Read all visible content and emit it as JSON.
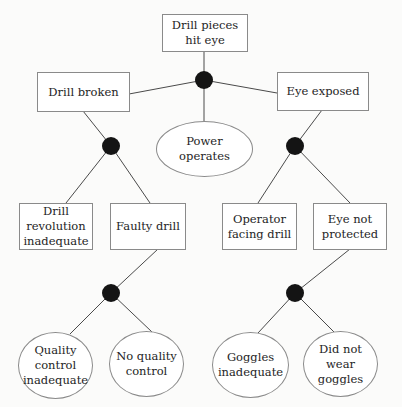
{
  "diagram": {
    "type": "fault-tree",
    "top_event": {
      "id": "top",
      "label": "Drill pieces\nhit eye",
      "shape": "rectangle"
    },
    "gates": [
      {
        "id": "g1",
        "type": "AND",
        "parent": "top",
        "inputs": [
          "drill_broken",
          "power_operates",
          "eye_exposed"
        ]
      },
      {
        "id": "g2",
        "type": "AND",
        "parent": "drill_broken",
        "inputs": [
          "drill_revolution",
          "faulty_drill"
        ]
      },
      {
        "id": "g3",
        "type": "AND",
        "parent": "eye_exposed",
        "inputs": [
          "operator_facing",
          "eye_not_protected"
        ]
      },
      {
        "id": "g4",
        "type": "AND",
        "parent": "faulty_drill",
        "inputs": [
          "qc_inadequate",
          "no_qc"
        ]
      },
      {
        "id": "g5",
        "type": "AND",
        "parent": "eye_not_protected",
        "inputs": [
          "goggles_inadequate",
          "no_goggles"
        ]
      }
    ],
    "nodes": {
      "drill_broken": {
        "label": "Drill broken",
        "shape": "rectangle"
      },
      "power_operates": {
        "label": "Power\noperates",
        "shape": "ellipse"
      },
      "eye_exposed": {
        "label": "Eye exposed",
        "shape": "rectangle"
      },
      "drill_revolution": {
        "label": "Drill\nrevolution\ninadequate",
        "shape": "rectangle"
      },
      "faulty_drill": {
        "label": "Faulty drill",
        "shape": "rectangle"
      },
      "operator_facing": {
        "label": "Operator\nfacing drill",
        "shape": "rectangle"
      },
      "eye_not_protected": {
        "label": "Eye not\nprotected",
        "shape": "rectangle"
      },
      "qc_inadequate": {
        "label": "Quality\ncontrol\ninadequate",
        "shape": "ellipse"
      },
      "no_qc": {
        "label": "No quality\ncontrol",
        "shape": "ellipse"
      },
      "goggles_inadequate": {
        "label": "Goggles\ninadequate",
        "shape": "ellipse"
      },
      "no_goggles": {
        "label": "Did not\nwear\ngoggles",
        "shape": "ellipse"
      }
    },
    "colors": {
      "line": "#4a4a4a",
      "gate_fill": "#141414",
      "border": "#8a8a8a",
      "text": "#1e1e1e"
    }
  }
}
